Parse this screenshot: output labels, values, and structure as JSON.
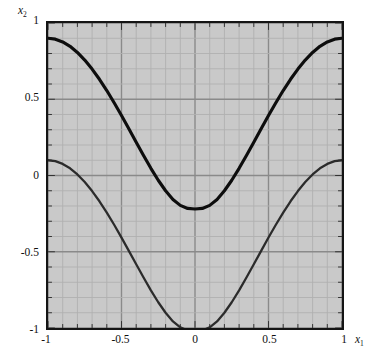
{
  "figure": {
    "background_color": "#ffffff",
    "plot_background_color": "#c9c9c9",
    "frame_color": "#141414",
    "minor_grid_color": "#b0b0b0",
    "major_grid_color": "#8a8a8a"
  },
  "axes": {
    "x": {
      "name": "x",
      "subscript": "1",
      "min": -1,
      "max": 1,
      "ticks": [
        -1,
        -0.5,
        0,
        0.5,
        1
      ],
      "tick_labels": [
        "-1",
        "-0.5",
        "0",
        "0.5",
        "1"
      ],
      "minor_step": 0.1
    },
    "y": {
      "name": "x",
      "subscript": "2",
      "min": -1,
      "max": 1,
      "ticks": [
        -1,
        -0.5,
        0,
        0.5,
        1
      ],
      "tick_labels": [
        "-1",
        "-0.5",
        "0",
        "0.5",
        "1"
      ],
      "minor_step": 0.1
    }
  },
  "chart_data": {
    "type": "line",
    "title": "",
    "xlabel": "x1",
    "ylabel": "x2",
    "xlim": [
      -1,
      1
    ],
    "ylim": [
      -1,
      1
    ],
    "grid": true,
    "legend": "none",
    "x": [
      -1,
      -0.95,
      -0.9,
      -0.85,
      -0.8,
      -0.75,
      -0.7,
      -0.65,
      -0.6,
      -0.55,
      -0.5,
      -0.45,
      -0.4,
      -0.35,
      -0.3,
      -0.25,
      -0.2,
      -0.15,
      -0.1,
      -0.05,
      0,
      0.05,
      0.1,
      0.15,
      0.2,
      0.25,
      0.3,
      0.35,
      0.4,
      0.45,
      0.5,
      0.55,
      0.6,
      0.65,
      0.7,
      0.75,
      0.8,
      0.85,
      0.9,
      0.95,
      1
    ],
    "series": [
      {
        "name": "upper-branch",
        "color": "#0d0d0d",
        "line_width": 3.2,
        "values": [
          0.9,
          0.894,
          0.876,
          0.847,
          0.807,
          0.757,
          0.698,
          0.631,
          0.557,
          0.477,
          0.393,
          0.306,
          0.218,
          0.131,
          0.047,
          -0.031,
          -0.1,
          -0.157,
          -0.196,
          -0.216,
          -0.22,
          -0.216,
          -0.196,
          -0.157,
          -0.1,
          -0.031,
          0.047,
          0.131,
          0.218,
          0.306,
          0.393,
          0.477,
          0.557,
          0.631,
          0.698,
          0.757,
          0.807,
          0.847,
          0.876,
          0.894,
          0.9
        ]
      },
      {
        "name": "lower-branch",
        "color": "#2b2b2b",
        "line_width": 2.3,
        "values": [
          0.1,
          0.094,
          0.076,
          0.047,
          0.007,
          -0.043,
          -0.102,
          -0.169,
          -0.243,
          -0.323,
          -0.407,
          -0.494,
          -0.582,
          -0.669,
          -0.753,
          -0.831,
          -0.9,
          -0.957,
          -0.996,
          -1.016,
          -1.02,
          -1.016,
          -0.996,
          -0.957,
          -0.9,
          -0.831,
          -0.753,
          -0.669,
          -0.582,
          -0.494,
          -0.407,
          -0.323,
          -0.243,
          -0.169,
          -0.102,
          -0.043,
          0.007,
          0.047,
          0.076,
          0.094,
          0.1
        ]
      }
    ]
  }
}
